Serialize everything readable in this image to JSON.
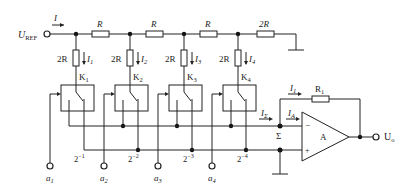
{
  "diagram": {
    "type": "circuit-schematic",
    "input_terminal": {
      "label": "U",
      "sub": "REF"
    },
    "input_current": {
      "label": "I"
    },
    "ladder_series_resistors": [
      "R",
      "R",
      "R",
      "2R"
    ],
    "branches": [
      {
        "resistor": "2R",
        "current": "I",
        "current_sub": "1",
        "switch": "K",
        "switch_sub": "1",
        "weight": "2",
        "weight_exp": "−1",
        "input": "a",
        "input_sub": "1"
      },
      {
        "resistor": "2R",
        "current": "I",
        "current_sub": "2",
        "switch": "K",
        "switch_sub": "2",
        "weight": "2",
        "weight_exp": "−2",
        "input": "a",
        "input_sub": "2"
      },
      {
        "resistor": "2R",
        "current": "I",
        "current_sub": "3",
        "switch": "K",
        "switch_sub": "3",
        "weight": "2",
        "weight_exp": "−3",
        "input": "a",
        "input_sub": "3"
      },
      {
        "resistor": "2R",
        "current": "I",
        "current_sub": "4",
        "switch": "K",
        "switch_sub": "4",
        "weight": "2",
        "weight_exp": "−4",
        "input": "a",
        "input_sub": "4"
      }
    ],
    "summing_node": {
      "label": "Σ",
      "current": "I",
      "current_sub": "Σ"
    },
    "opamp": {
      "label": "A",
      "minus": "−",
      "plus": "+",
      "input_current": "I",
      "input_current_sub": "A"
    },
    "feedback": {
      "resistor": "R",
      "resistor_sub": "1",
      "current": "I",
      "current_sub": "1"
    },
    "output_terminal": {
      "label": "U",
      "sub": "o"
    }
  }
}
